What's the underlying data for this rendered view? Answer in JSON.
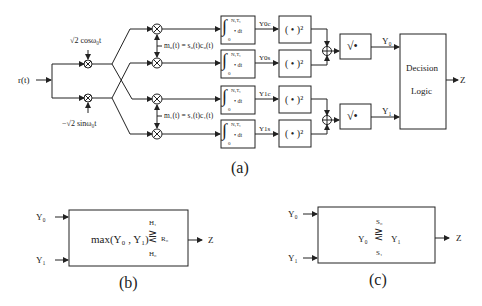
{
  "figure_a": {
    "caption": "(a)",
    "input_label": "r(t)",
    "carrier_cos": "√2 cosω₀t",
    "carrier_sin": "−√2 sinω₀t",
    "code_0": "m₀(t) = s₀(t)c₀(t)",
    "code_1": "m₁(t) = s₁(t)c₁(t)",
    "integrator": {
      "upper": "N₁T꜀",
      "lower": "0",
      "body": "• dt"
    },
    "integrator_outputs": [
      "Y0c",
      "Y0s",
      "Y1c",
      "Y1s"
    ],
    "square_label": "( • )²",
    "sqrt_label": "√•",
    "sum_symbol": "⊕",
    "outputs": [
      "Y₀",
      "Y₁"
    ],
    "decision_block": [
      "Decision",
      "Logic"
    ],
    "decision_output": "Z"
  },
  "figure_b": {
    "caption": "(b)",
    "inputs": [
      "Y₀",
      "Y₁"
    ],
    "rule_expr": "max(Y₀ , Y₁)",
    "rule_top": "H₁",
    "rule_bottom": "H₀",
    "rule_rhs": "R₀",
    "output": "Z"
  },
  "figure_c": {
    "caption": "(c)",
    "inputs": [
      "Y₀",
      "Y₁"
    ],
    "rule_lhs": "Y₀",
    "rule_rhs": "Y₁",
    "rule_top": "S₀",
    "rule_bottom": "S₁",
    "output": "Z"
  }
}
